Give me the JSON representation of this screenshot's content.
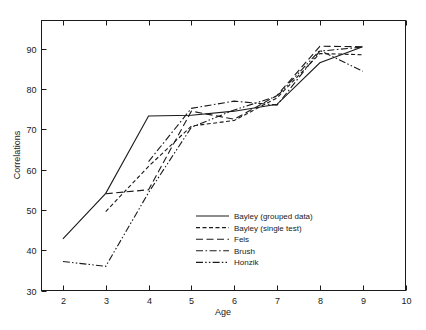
{
  "chart_data": {
    "type": "line",
    "title": "",
    "xlabel": "Age",
    "ylabel": "Correlations",
    "xlim": [
      1.5,
      10
    ],
    "ylim": [
      30,
      97
    ],
    "xticks": [
      2,
      3,
      4,
      5,
      6,
      7,
      8,
      9,
      10
    ],
    "yticks": [
      30,
      40,
      50,
      60,
      70,
      80,
      90
    ],
    "grid": false,
    "legend_position": "center-right",
    "line_color": "#1a1a1a",
    "series": [
      {
        "name": "Bayley (grouped data)",
        "style": "solid",
        "x": [
          2,
          3,
          4,
          5,
          6,
          7,
          8,
          9
        ],
        "values": [
          42.8,
          54.1,
          73.3,
          73.5,
          74.5,
          76.2,
          86.5,
          90.5
        ]
      },
      {
        "name": "Bayley (single test)",
        "style": "dashed",
        "x": [
          3,
          4,
          5,
          6,
          7,
          8,
          9
        ],
        "values": [
          49.6,
          60.8,
          70.8,
          72.2,
          77.8,
          88.8,
          88.5
        ]
      },
      {
        "name": "Fels",
        "style": "longdash",
        "x": [
          3,
          4,
          5,
          6,
          7,
          8,
          9
        ],
        "values": [
          54.0,
          55.0,
          74.5,
          72.5,
          78.4,
          90.6,
          90.5
        ]
      },
      {
        "name": "Brush",
        "style": "dashdot",
        "x": [
          4,
          5,
          6,
          7,
          8,
          9
        ],
        "values": [
          62.0,
          75.2,
          77.0,
          76.0,
          89.4,
          90.4
        ]
      },
      {
        "name": "Honzik",
        "style": "dashdotdot",
        "x": [
          2,
          3,
          4,
          5,
          6,
          7,
          8,
          9
        ],
        "values": [
          37.2,
          36.0,
          54.3,
          70.5,
          74.8,
          78.2,
          89.6,
          84.4
        ]
      }
    ],
    "legend": [
      {
        "label": "Bayley (grouped data)",
        "style": "solid"
      },
      {
        "label": "Bayley (single test)",
        "style": "dashed"
      },
      {
        "label": "Fels",
        "style": "longdash"
      },
      {
        "label": "Brush",
        "style": "dashdot"
      },
      {
        "label": "Honzik",
        "style": "dashdotdot"
      }
    ]
  }
}
